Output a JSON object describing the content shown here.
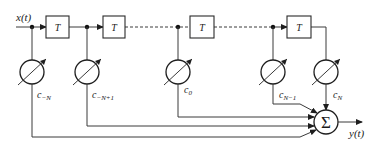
{
  "diagram": {
    "type": "FIR transversal filter / tapped delay line",
    "input_label": "x(t)",
    "output_label": "y(t)",
    "delay_label": "T",
    "delays": [
      {
        "id": "delay-1",
        "label": "T"
      },
      {
        "id": "delay-2",
        "label": "T"
      },
      {
        "id": "delay-3",
        "label": "T"
      },
      {
        "id": "delay-4",
        "label": "T"
      }
    ],
    "taps": [
      {
        "id": "tap-c-minus-n",
        "base": "c",
        "subscript": "−N"
      },
      {
        "id": "tap-c-minus-n-plus-1",
        "base": "c",
        "subscript": "−N+1"
      },
      {
        "id": "tap-c-0",
        "base": "c",
        "subscript": "0"
      },
      {
        "id": "tap-c-n-minus-1",
        "base": "c",
        "subscript": "N−1"
      },
      {
        "id": "tap-c-n",
        "base": "c",
        "subscript": "N"
      }
    ],
    "summer_symbol": "Σ",
    "colors": {
      "line": "#3a3a3a",
      "stroke": "#1e1e1e",
      "background": "#ffffff"
    }
  }
}
